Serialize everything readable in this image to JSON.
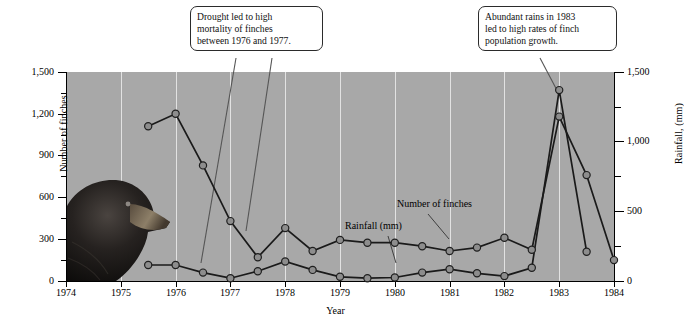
{
  "chart_data": {
    "type": "line",
    "title": "",
    "xlabel": "Year",
    "ylabel": "Number of finches",
    "ylabel_right": "Rainfall, (mm)",
    "xlim": [
      1974,
      1984
    ],
    "ylim": [
      0,
      1500
    ],
    "ylim_right": [
      0,
      1500
    ],
    "grid": true,
    "legend_position": "inline-annotations",
    "xticks": [
      "1974",
      "1975",
      "1976",
      "1977",
      "1978",
      "1979",
      "1980",
      "1981",
      "1982",
      "1983",
      "1984"
    ],
    "yticks_left": [
      "0",
      "300",
      "600",
      "900",
      "1,200",
      "1,500"
    ],
    "yticks_right": [
      "0",
      "500",
      "1,000",
      "1,500"
    ],
    "series": [
      {
        "name": "Number of finches",
        "x": [
          1975.5,
          1976.0,
          1976.5,
          1977.0,
          1977.5,
          1978.0,
          1978.5,
          1979.0,
          1979.5,
          1980.0,
          1980.5,
          1981.0,
          1981.5,
          1982.0,
          1982.5,
          1983.0,
          1983.5,
          1984.0
        ],
        "values": [
          1110,
          1200,
          830,
          430,
          170,
          380,
          215,
          295,
          275,
          275,
          250,
          215,
          240,
          310,
          225,
          1180,
          760,
          150
        ]
      },
      {
        "name": "Rainfall (mm)",
        "x": [
          1975.5,
          1976.0,
          1976.5,
          1977.0,
          1977.5,
          1978.0,
          1978.5,
          1979.0,
          1979.5,
          1980.0,
          1980.5,
          1981.0,
          1981.5,
          1982.0,
          1982.5,
          1983.0,
          1983.5
        ],
        "values": [
          115,
          115,
          60,
          20,
          70,
          140,
          80,
          30,
          20,
          25,
          60,
          85,
          55,
          35,
          95,
          1370,
          210
        ]
      }
    ],
    "annotations": [
      {
        "name": "drought-callout",
        "lines": [
          "Drought led to high",
          "mortality of finches",
          "between 1976 and 1977."
        ]
      },
      {
        "name": "rains-callout",
        "lines": [
          "Abundant rains in 1983",
          "led to high rates of finch",
          "population growth."
        ]
      },
      {
        "name": "finches-inline-label",
        "text": "Number of finches"
      },
      {
        "name": "rainfall-inline-label",
        "text": "Rainfall (mm)"
      }
    ],
    "colors": {
      "plot_background": "#a8a8a8",
      "gridline": "#e2e2e2",
      "line": "#1a1a1a",
      "marker_fill": "#8d8d8d",
      "marker_stroke": "#1f1f1f",
      "callout_border": "#2b2b2b",
      "page_background": "#ffffff"
    },
    "image_inset": {
      "name": "finch-photo",
      "description": "Darwin's finch head photograph"
    }
  }
}
